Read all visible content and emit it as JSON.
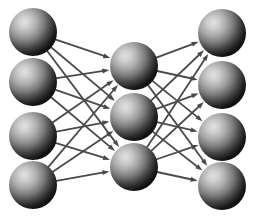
{
  "diagram": {
    "type": "neural-network",
    "background_color": "#ffffff",
    "canvas": {
      "width": 257,
      "height": 216
    },
    "node": {
      "radius": 24,
      "shape": "sphere",
      "highlight_color": "#d8d8d8",
      "midtone_color": "#8a8a8a",
      "shadow_color": "#151515",
      "highlight_offset_x": "32%",
      "highlight_offset_y": "29%"
    },
    "edge": {
      "color": "#4a4a4a",
      "width": 1.8,
      "arrowhead": "solid-triangle",
      "arrowhead_length": 7,
      "arrowhead_width": 5,
      "directed": true
    },
    "layers": [
      {
        "name": "input-layer",
        "label": "Input Layer",
        "x": 33,
        "count": 4,
        "nodes": [
          {
            "id": "i1",
            "label": "Input 1",
            "cx": 33,
            "cy": 32
          },
          {
            "id": "i2",
            "label": "Input 2",
            "cx": 33,
            "cy": 82
          },
          {
            "id": "i3",
            "label": "Input 3",
            "cx": 33,
            "cy": 136
          },
          {
            "id": "i4",
            "label": "Input 4",
            "cx": 33,
            "cy": 185
          }
        ]
      },
      {
        "name": "hidden-layer",
        "label": "Hidden Layer",
        "x": 134,
        "count": 3,
        "nodes": [
          {
            "id": "h1",
            "label": "Hidden 1",
            "cx": 134,
            "cy": 66
          },
          {
            "id": "h2",
            "label": "Hidden 2",
            "cx": 134,
            "cy": 117
          },
          {
            "id": "h3",
            "label": "Hidden 3",
            "cx": 134,
            "cy": 167
          }
        ]
      },
      {
        "name": "output-layer",
        "label": "Output Layer",
        "x": 222,
        "count": 4,
        "nodes": [
          {
            "id": "o1",
            "label": "Output 1",
            "cx": 222,
            "cy": 33
          },
          {
            "id": "o2",
            "label": "Output 2",
            "cx": 222,
            "cy": 85
          },
          {
            "id": "o3",
            "label": "Output 3",
            "cx": 222,
            "cy": 137
          },
          {
            "id": "o4",
            "label": "Output 4",
            "cx": 222,
            "cy": 186
          }
        ]
      }
    ],
    "connections": [
      {
        "from": "i1",
        "to": "h1"
      },
      {
        "from": "i1",
        "to": "h2"
      },
      {
        "from": "i1",
        "to": "h3"
      },
      {
        "from": "i2",
        "to": "h1"
      },
      {
        "from": "i2",
        "to": "h2"
      },
      {
        "from": "i2",
        "to": "h3"
      },
      {
        "from": "i3",
        "to": "h1"
      },
      {
        "from": "i3",
        "to": "h2"
      },
      {
        "from": "i3",
        "to": "h3"
      },
      {
        "from": "i4",
        "to": "h1"
      },
      {
        "from": "i4",
        "to": "h2"
      },
      {
        "from": "i4",
        "to": "h3"
      },
      {
        "from": "h1",
        "to": "o1"
      },
      {
        "from": "h1",
        "to": "o2"
      },
      {
        "from": "h1",
        "to": "o3"
      },
      {
        "from": "h1",
        "to": "o4"
      },
      {
        "from": "h2",
        "to": "o1"
      },
      {
        "from": "h2",
        "to": "o2"
      },
      {
        "from": "h2",
        "to": "o3"
      },
      {
        "from": "h2",
        "to": "o4"
      },
      {
        "from": "h3",
        "to": "o1"
      },
      {
        "from": "h3",
        "to": "o2"
      },
      {
        "from": "h3",
        "to": "o3"
      },
      {
        "from": "h3",
        "to": "o4"
      }
    ]
  }
}
